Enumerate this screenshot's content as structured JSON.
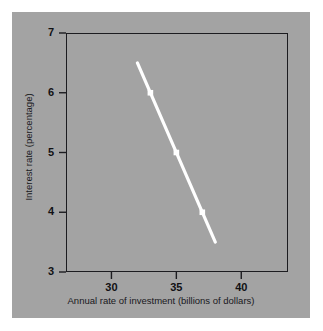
{
  "figure": {
    "background_color": "#ffffff",
    "panel_color": "#a3a3a3",
    "frame_color": "#1c1c20",
    "line_color": "#ffffff",
    "text_color": "#18181c"
  },
  "chart_data": {
    "type": "line",
    "title": "",
    "subtitle": "",
    "xlabel": "Annual rate of investment (billions of dollars)",
    "ylabel": "Interest rate (percentage)",
    "xlim": [
      26.5,
      43.6
    ],
    "ylim": [
      3,
      7
    ],
    "xticks": [
      30,
      35,
      40
    ],
    "xtick_labels": [
      "30",
      "35",
      "40"
    ],
    "yticks": [
      3,
      4,
      5,
      6,
      7
    ],
    "ytick_labels": [
      "3",
      "4",
      "5",
      "6",
      "7"
    ],
    "grid": false,
    "legend": null,
    "legend_position": "none",
    "annotations": [],
    "series": [
      {
        "name": "Investment demand",
        "color": "#ffffff",
        "line_width": 3,
        "marker": "square",
        "x": [
          32.0,
          33.0,
          35.0,
          37.0,
          38.0
        ],
        "y": [
          6.5,
          6.0,
          5.0,
          4.0,
          3.5
        ],
        "marked_points": [
          {
            "x": 33.0,
            "y": 6.0
          },
          {
            "x": 35.0,
            "y": 5.0
          },
          {
            "x": 37.0,
            "y": 4.0
          }
        ]
      }
    ]
  }
}
